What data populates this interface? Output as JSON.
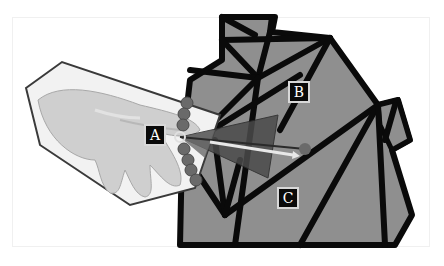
{
  "figure": {
    "labels": [
      {
        "id": "A",
        "text": "A"
      },
      {
        "id": "B",
        "text": "B"
      },
      {
        "id": "C",
        "text": "C"
      }
    ],
    "colors": {
      "mesh_fill": "#8f8f8f",
      "mesh_edge": "#0a0a0a",
      "hand_panel_fill": "#eeeeee",
      "hand_panel_edge": "#3a3a3a",
      "joint_dots": "#6a6a6a",
      "cone_fill": "#4a4a4a",
      "ray": "#e8e8e8",
      "label_bg": "#0a0a0a",
      "label_text": "#ffffff"
    },
    "elements": [
      "hand-image-panel",
      "mesh-object",
      "joint-chain",
      "pointing-cone",
      "pointing-ray",
      "target-dot"
    ]
  }
}
